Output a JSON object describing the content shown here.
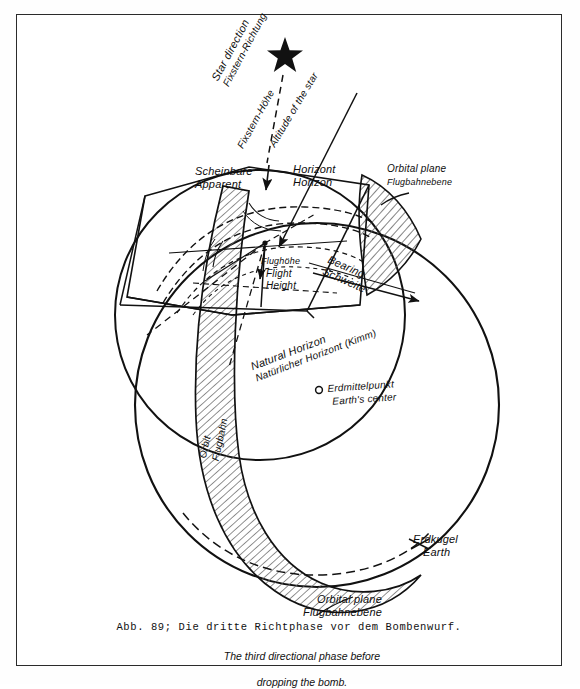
{
  "figure": {
    "number": "Abb. 89;",
    "caption_de": "Abb. 89; Die dritte Richtphase vor dem Bombenwurf.",
    "caption_en_line1": "The third directional phase before",
    "caption_en_line2": "dropping the bomb."
  },
  "labels": {
    "star_direction": {
      "en": "Star direction",
      "de": "Fixstern-Richtung"
    },
    "star_altitude": {
      "de": "Fixstern-Höhe",
      "en": "Altitude of the star"
    },
    "apparent_horizon": {
      "de": "Scheinbare",
      "en": "Apparent"
    },
    "horizon": {
      "de": "Horizont",
      "en": "Horizon"
    },
    "orbital_plane_top": {
      "en": "Orbital plane",
      "de": "Flugbahnebene"
    },
    "orbital_plane_bottom": {
      "en": "Orbital plane",
      "de": "Flugbahnebene"
    },
    "flight_height": {
      "de": "Flughöhe",
      "en1": "Flight",
      "en2": "Height"
    },
    "bearing": {
      "en": "Bearing",
      "de": "Schweite"
    },
    "natural_horizon": {
      "en": "Natural Horizon",
      "de": "Natürlicher Horizont (Kimm)"
    },
    "earth_center": {
      "de": "Erdmittelpunkt",
      "en": "Earth's center"
    },
    "earth": {
      "de": "Erdkugel",
      "en": "Earth"
    },
    "orbit": {
      "de": "Flugbahn",
      "en": "Orbit"
    }
  },
  "colors": {
    "ink": "#111111",
    "frame": "#2b2b2b",
    "hatch": "#555555",
    "paper": "#ffffff"
  },
  "markers": {
    "star_glyph": "star",
    "earth_center_glyph": "circle-small"
  }
}
